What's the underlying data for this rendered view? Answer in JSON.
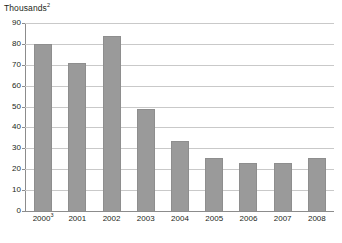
{
  "chart_data": {
    "type": "bar",
    "title": "Thousands",
    "title_superscript": "2",
    "xlabel": "",
    "ylabel": "",
    "ylim": [
      0,
      90
    ],
    "ytick_step": 10,
    "grid": true,
    "legend": "none",
    "categories": [
      "2000",
      "2001",
      "2002",
      "2003",
      "2004",
      "2005",
      "2006",
      "2007",
      "2008"
    ],
    "category_superscripts": [
      "3",
      "",
      "",
      "",
      "",
      "",
      "",
      "",
      ""
    ],
    "values": [
      80,
      71,
      84,
      49,
      33.5,
      25.5,
      23,
      22.8,
      25.3
    ],
    "ytick_labels": [
      "90",
      "80",
      "70",
      "60",
      "50",
      "40",
      "30",
      "20",
      "10",
      "0"
    ],
    "bar_color": "#9a9a9a",
    "grid_color": "#c9c9c9",
    "axis_color": "#8c8c8c",
    "text_color": "#231f20"
  },
  "footnote": {
    "clipped_text": ""
  }
}
